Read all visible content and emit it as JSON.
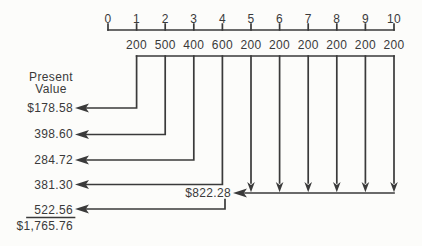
{
  "figure": {
    "axis_title": {
      "line1": "Present",
      "line2": "Value"
    },
    "timeline": {
      "period_labels": [
        "0",
        "1",
        "2",
        "3",
        "4",
        "5",
        "6",
        "7",
        "8",
        "9",
        "10"
      ],
      "cash_flows": [
        "200",
        "500",
        "400",
        "600",
        "200",
        "200",
        "200",
        "200",
        "200",
        "200"
      ]
    },
    "present_values": {
      "pv1": "$178.58",
      "pv2": "398.60",
      "pv3": "284.72",
      "pv4": "381.30",
      "pv5": "522.56"
    },
    "annuity_pv": "$822.28",
    "total": "$1,765.76"
  },
  "colors": {
    "ink": "#3a3a3a",
    "paper": "#fcfcfa"
  }
}
